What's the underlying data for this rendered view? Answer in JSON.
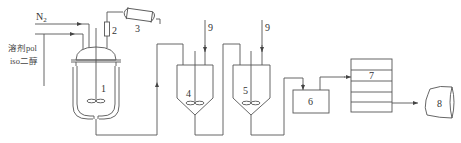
{
  "diagram": {
    "inputs": {
      "nitrogen": "N",
      "nitrogen_subscript": "2",
      "solvent_line1": "溶剂pol",
      "solvent_line2": "iso二醇"
    },
    "units": [
      {
        "id": "1",
        "type": "jacketed-reactor"
      },
      {
        "id": "2",
        "type": "column"
      },
      {
        "id": "3",
        "type": "condenser"
      },
      {
        "id": "4",
        "type": "stirred-tank"
      },
      {
        "id": "5",
        "type": "stirred-tank"
      },
      {
        "id": "6",
        "type": "box"
      },
      {
        "id": "7",
        "type": "multi-layer-unit"
      },
      {
        "id": "8",
        "type": "product-container"
      }
    ],
    "feed_labels": [
      "9",
      "9"
    ],
    "colors": {
      "line": "#555555",
      "background": "#ffffff"
    }
  }
}
